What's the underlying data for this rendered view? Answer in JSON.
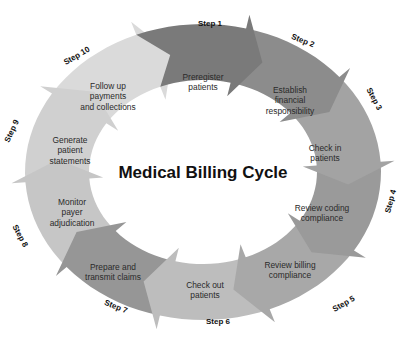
{
  "title": "Medical Billing Cycle",
  "steps": [
    {
      "step": "Step 1",
      "lines": [
        "Preregister",
        "patients"
      ],
      "color": "#7a7a7a"
    },
    {
      "step": "Step 2",
      "lines": [
        "Establish",
        "financial",
        "responsibility"
      ],
      "color": "#8c8c8c"
    },
    {
      "step": "Step 3",
      "lines": [
        "Check in",
        "patients"
      ],
      "color": "#a3a3a3"
    },
    {
      "step": "Step 4",
      "lines": [
        "Review coding",
        "compliance"
      ],
      "color": "#9a9a9a"
    },
    {
      "step": "Step 5",
      "lines": [
        "Review billing",
        "compliance"
      ],
      "color": "#a8a8a8"
    },
    {
      "step": "Step 6",
      "lines": [
        "Check out",
        "patients"
      ],
      "color": "#bdbdbd"
    },
    {
      "step": "Step 7",
      "lines": [
        "Prepare and",
        "transmit claims"
      ],
      "color": "#969696"
    },
    {
      "step": "Step 8",
      "lines": [
        "Monitor",
        "payer",
        "adjudication"
      ],
      "color": "#c6c6c6"
    },
    {
      "step": "Step 9",
      "lines": [
        "Generate",
        "patient",
        "statements"
      ],
      "color": "#d0d0d0"
    },
    {
      "step": "Step 10",
      "lines": [
        "Follow up",
        "payments",
        "and collections"
      ],
      "color": "#dadada"
    }
  ]
}
